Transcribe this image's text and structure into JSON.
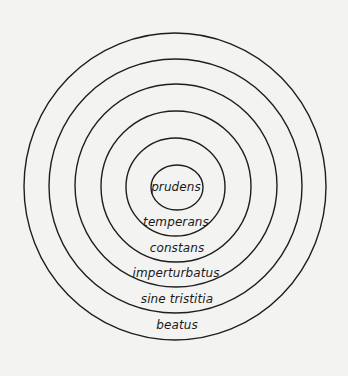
{
  "diagram": {
    "type": "concentric-circles",
    "colors": {
      "background": "#f3f3f1",
      "stroke": "#1e1e1e",
      "text": "#1a1a1a"
    },
    "rings": [
      {
        "label": "prudens",
        "cx": 177,
        "cy": 187.5,
        "rx": 26,
        "ry": 22.5,
        "label_x": 176,
        "label_y": 187
      },
      {
        "label": "temperans",
        "cx": 175.5,
        "cy": 187,
        "rx": 49.5,
        "ry": 49,
        "label_x": 176,
        "label_y": 222
      },
      {
        "label": "constans",
        "cx": 176,
        "cy": 186.5,
        "rx": 75,
        "ry": 75.5,
        "label_x": 177,
        "label_y": 248
      },
      {
        "label": "imperturbatus",
        "cx": 176,
        "cy": 185.5,
        "rx": 101,
        "ry": 101.5,
        "label_x": 176,
        "label_y": 273
      },
      {
        "label": "sine tristitia",
        "cx": 175.5,
        "cy": 186,
        "rx": 126.5,
        "ry": 127,
        "label_x": 177,
        "label_y": 299
      },
      {
        "label": "beatus",
        "cx": 175,
        "cy": 186.5,
        "rx": 151,
        "ry": 153.5,
        "label_x": 177,
        "label_y": 325
      }
    ]
  }
}
